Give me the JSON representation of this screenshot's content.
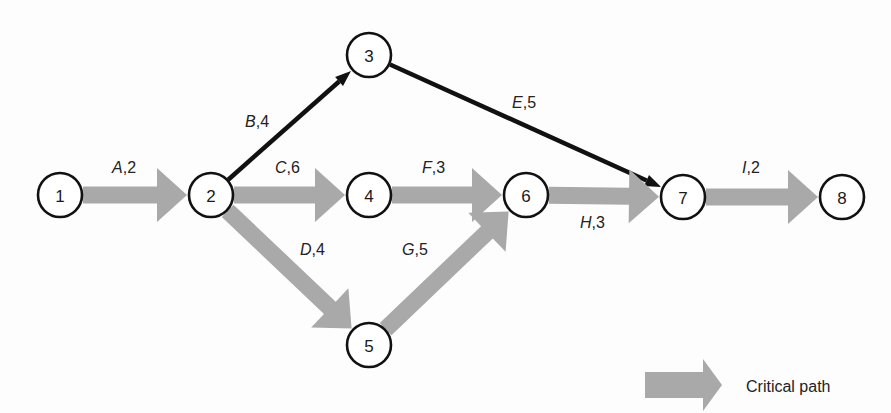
{
  "diagram": {
    "type": "activity-on-arrow network",
    "colors": {
      "critical": "#a9a9a9",
      "noncritical": "#111111",
      "node_stroke": "#111111"
    },
    "nodes": [
      {
        "id": "1",
        "label": "1",
        "x": 60,
        "y": 195
      },
      {
        "id": "2",
        "label": "2",
        "x": 211,
        "y": 195
      },
      {
        "id": "3",
        "label": "3",
        "x": 369,
        "y": 55
      },
      {
        "id": "4",
        "label": "4",
        "x": 369,
        "y": 195
      },
      {
        "id": "5",
        "label": "5",
        "x": 369,
        "y": 345
      },
      {
        "id": "6",
        "label": "6",
        "x": 526,
        "y": 195
      },
      {
        "id": "7",
        "label": "7",
        "x": 683,
        "y": 197
      },
      {
        "id": "8",
        "label": "8",
        "x": 842,
        "y": 197
      }
    ],
    "edges": [
      {
        "activity": "A",
        "duration": "2",
        "from": "1",
        "to": "2",
        "critical": true,
        "label_x": 112,
        "label_y": 173
      },
      {
        "activity": "B",
        "duration": "4",
        "from": "2",
        "to": "3",
        "critical": false,
        "label_x": 245,
        "label_y": 127
      },
      {
        "activity": "C",
        "duration": "6",
        "from": "2",
        "to": "4",
        "critical": true,
        "label_x": 275,
        "label_y": 173
      },
      {
        "activity": "D",
        "duration": "4",
        "from": "2",
        "to": "5",
        "critical": true,
        "label_x": 300,
        "label_y": 255
      },
      {
        "activity": "E",
        "duration": "5",
        "from": "3",
        "to": "7",
        "critical": false,
        "label_x": 512,
        "label_y": 108
      },
      {
        "activity": "F",
        "duration": "3",
        "from": "4",
        "to": "6",
        "critical": true,
        "label_x": 422,
        "label_y": 173
      },
      {
        "activity": "G",
        "duration": "5",
        "from": "5",
        "to": "6",
        "critical": true,
        "label_x": 402,
        "label_y": 255
      },
      {
        "activity": "H",
        "duration": "3",
        "from": "6",
        "to": "7",
        "critical": true,
        "label_x": 580,
        "label_y": 228
      },
      {
        "activity": "I",
        "duration": "2",
        "from": "7",
        "to": "8",
        "critical": true,
        "label_x": 742,
        "label_y": 173
      }
    ],
    "legend": {
      "label": "Critical path",
      "symbol": "thick gray arrow"
    }
  }
}
